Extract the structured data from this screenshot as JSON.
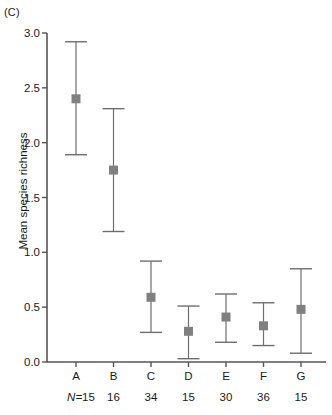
{
  "panel": {
    "label": "(C)"
  },
  "axes": {
    "ylabel": "Mean species richness",
    "yticks": [
      "0.0",
      "0.5",
      "1.0",
      "1.5",
      "2.0",
      "2.5",
      "3.0"
    ],
    "n_prefix": "N=",
    "marker_color": "#808080",
    "line_color": "#6e6e6e",
    "axis_color": "#555555"
  },
  "chart_data": {
    "type": "scatter",
    "title": "(C)",
    "xlabel": "",
    "ylabel": "Mean species richness",
    "ylim": [
      0.0,
      3.0
    ],
    "yticks": [
      0.0,
      0.5,
      1.0,
      1.5,
      2.0,
      2.5,
      3.0
    ],
    "grid": false,
    "legend": "none",
    "error_bars": "vertical with end caps",
    "categories": [
      "A",
      "B",
      "C",
      "D",
      "E",
      "F",
      "G"
    ],
    "sample_sizes": [
      15,
      16,
      34,
      15,
      30,
      36,
      15
    ],
    "sample_size_label": "N",
    "values": [
      2.4,
      1.75,
      0.59,
      0.28,
      0.41,
      0.33,
      0.48
    ],
    "error_lower": [
      1.89,
      1.19,
      0.27,
      0.03,
      0.18,
      0.15,
      0.08
    ],
    "error_upper": [
      2.92,
      2.31,
      0.92,
      0.51,
      0.62,
      0.54,
      0.85
    ],
    "series": [
      {
        "name": "Mean species richness",
        "points": [
          {
            "category": "A",
            "n": 15,
            "mean": 2.4,
            "lower": 1.89,
            "upper": 2.92
          },
          {
            "category": "B",
            "n": 16,
            "mean": 1.75,
            "lower": 1.19,
            "upper": 2.31
          },
          {
            "category": "C",
            "n": 34,
            "mean": 0.59,
            "lower": 0.27,
            "upper": 0.92
          },
          {
            "category": "D",
            "n": 15,
            "mean": 0.28,
            "lower": 0.03,
            "upper": 0.51
          },
          {
            "category": "E",
            "n": 30,
            "mean": 0.41,
            "lower": 0.18,
            "upper": 0.62
          },
          {
            "category": "F",
            "n": 36,
            "mean": 0.33,
            "lower": 0.15,
            "upper": 0.54
          },
          {
            "category": "G",
            "n": 15,
            "mean": 0.48,
            "lower": 0.08,
            "upper": 0.85
          }
        ]
      }
    ]
  }
}
